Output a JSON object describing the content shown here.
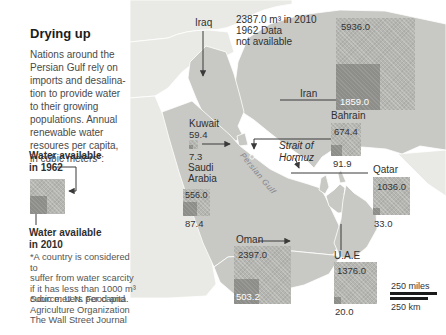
{
  "colors": {
    "land_focus": "#c8c8c4",
    "land_other": "#e9e9e5",
    "square_1962": "#b5b5b1",
    "square_2010": "#8d8d89",
    "leader_line": "#3a3a3a",
    "scalebar": "#1a1a1a"
  },
  "panel": {
    "title": "Drying up",
    "intro": "Nations around the\nPersian Gulf rely on\nimports and desalina-\ntion to provide water\nto their growing\npopulations. Annual\nrenewable water\nresoures per capita,\nin cubic meters*:",
    "legend": {
      "label_1962": "Water available\nin 1962",
      "label_2010": "Water available\nin 2010"
    },
    "footnote": "*A country is considered to\nsuffer from water scarcity\nif it has less than 1000 m³\ncubic meters per capita.",
    "source": "Source: U.N. Food and\nAgriculture Organization\nThe Wall Street Journal"
  },
  "map": {
    "persian_gulf": "Persian Gulf",
    "strait_of_hormuz": "Strait of\nHormuz",
    "iraq": {
      "label": "Iraq",
      "note": "2387.0 m³ in 2010\n1962 Data\nnot available"
    },
    "iran": {
      "label": "Iran",
      "v1962": "5936.0",
      "v2010": "1859.0"
    },
    "bahrain": {
      "label": "Bahrain",
      "v1962": "674.4",
      "v2010": "91.9"
    },
    "qatar": {
      "label": "Qatar",
      "v1962": "1036.0",
      "v2010": "33.0"
    },
    "uae": {
      "label": "U.A.E",
      "v1962": "1376.0",
      "v2010": "20.0"
    },
    "oman": {
      "label": "Oman",
      "v1962": "2397.0",
      "v2010": "503.2"
    },
    "saudi": {
      "label": "Saudi\nArabia",
      "v1962": "556.0",
      "v2010": "87.4"
    },
    "kuwait": {
      "label": "Kuwait",
      "v1962": "59.4",
      "v2010": "7.3"
    }
  },
  "scale": {
    "miles": "250 miles",
    "km": "250 km"
  }
}
